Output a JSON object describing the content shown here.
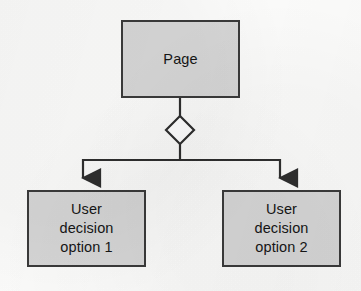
{
  "diagram": {
    "background_color": "#fbfbfa",
    "node_fill_color": "#d6d6d6",
    "node_border_color": "#3a3a3a",
    "connector_color": "#2e2e2e",
    "decision_fill_color": "#ffffff",
    "nodes": [
      {
        "id": "page",
        "type": "rectangle",
        "label": "Page",
        "x": 121,
        "y": 20,
        "width": 119,
        "height": 78
      },
      {
        "id": "decision",
        "type": "diamond",
        "label": "",
        "x": 166,
        "y": 116,
        "width": 28,
        "height": 28
      },
      {
        "id": "option-1",
        "type": "rectangle",
        "label": "User\ndecision\noption 1",
        "x": 27,
        "y": 190,
        "width": 119,
        "height": 77
      },
      {
        "id": "option-2",
        "type": "rectangle",
        "label": "User\ndecision\noption 2",
        "x": 222,
        "y": 190,
        "width": 119,
        "height": 77
      }
    ],
    "edges": [
      {
        "id": "page-to-decision",
        "from": "page",
        "to": "decision",
        "arrowhead": "none"
      },
      {
        "id": "decision-to-option-1",
        "from": "decision",
        "to": "option-1",
        "arrowhead": "filled-triangle"
      },
      {
        "id": "decision-to-option-2",
        "from": "decision",
        "to": "option-2",
        "arrowhead": "filled-triangle"
      }
    ]
  }
}
